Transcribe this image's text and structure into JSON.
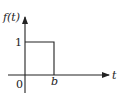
{
  "diagram": {
    "type": "signal-plot",
    "y_axis_label": "f(t)",
    "x_axis_label": "t",
    "y_tick_label": "1",
    "origin_label": "0",
    "x_tick_label": "b",
    "pulse": {
      "start": "0",
      "end": "b",
      "height": "1"
    },
    "colors": {
      "line": "#222222",
      "background": "#ffffff"
    }
  }
}
